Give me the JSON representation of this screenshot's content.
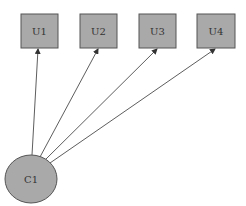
{
  "diagram": {
    "type": "graph",
    "colors": {
      "node_fill": "#a9a9a9",
      "node_stroke": "#555555",
      "edge": "#333333",
      "label": "#333333"
    },
    "nodes": [
      {
        "id": "U1",
        "label": "U1",
        "shape": "box",
        "x": 21,
        "y": 14,
        "w": 37,
        "h": 34
      },
      {
        "id": "U2",
        "label": "U2",
        "shape": "box",
        "x": 80,
        "y": 14,
        "w": 37,
        "h": 34
      },
      {
        "id": "U3",
        "label": "U3",
        "shape": "box",
        "x": 139,
        "y": 14,
        "w": 37,
        "h": 34
      },
      {
        "id": "U4",
        "label": "U4",
        "shape": "box",
        "x": 197,
        "y": 14,
        "w": 38,
        "h": 34
      },
      {
        "id": "C1",
        "label": "C1",
        "shape": "ellipse",
        "cx": 31,
        "cy": 179,
        "rx": 26,
        "ry": 24
      }
    ],
    "edges": [
      {
        "from": "C1",
        "to": "U1"
      },
      {
        "from": "C1",
        "to": "U2"
      },
      {
        "from": "C1",
        "to": "U3"
      },
      {
        "from": "C1",
        "to": "U4"
      }
    ]
  }
}
